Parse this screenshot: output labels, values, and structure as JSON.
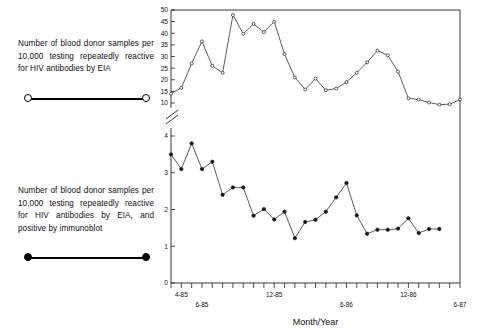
{
  "legend": {
    "items": [
      {
        "caption": "Number of blood donor samples per 10,000 testing repeatedly reactive for HIV antibodies by EIA",
        "marker": "open-circle-line"
      },
      {
        "caption": "Number of blood donor samples per 10,000 testing repeatedly reactive for HIV antibodies by EIA, and positive by immunoblot",
        "marker": "filled-circle-line"
      }
    ]
  },
  "chart_data": {
    "type": "line",
    "title": "",
    "xlabel": "Month/Year",
    "ylabel": "",
    "grid": false,
    "legend_position": "left-external",
    "panels": [
      {
        "name": "upper-panel",
        "ylim": [
          10,
          50
        ],
        "yticks": [
          10,
          15,
          20,
          25,
          30,
          35,
          40,
          45,
          50
        ],
        "ytick_labels": [
          "10",
          "15",
          "20",
          "25",
          "30",
          "35",
          "40",
          "45",
          "50"
        ],
        "axis_break_below": true,
        "series_name": "EIA repeatedly reactive per 10,000",
        "marker": "open-circle",
        "values": [
          14.0,
          16.5,
          27.0,
          36.5,
          26.0,
          23.0,
          47.8,
          39.8,
          44.0,
          40.5,
          45.0,
          31.0,
          21.0,
          15.8,
          20.5,
          15.5,
          16.2,
          19.0,
          23.0,
          27.5,
          32.5,
          30.5,
          23.5,
          12.0,
          11.5,
          10.2,
          9.3,
          9.5,
          11.5
        ]
      },
      {
        "name": "lower-panel",
        "ylim": [
          0,
          4
        ],
        "yticks": [
          0,
          1,
          2,
          3,
          4
        ],
        "ytick_labels": [
          "0",
          "1",
          "2",
          "3",
          "4"
        ],
        "series_name": "EIA reactive and immunoblot positive per 10,000",
        "marker": "filled-circle",
        "values": [
          3.5,
          3.1,
          3.8,
          3.1,
          3.3,
          2.4,
          2.6,
          2.6,
          1.83,
          2.01,
          1.73,
          1.94,
          1.22,
          1.66,
          1.72,
          1.94,
          2.33,
          2.72,
          1.84,
          1.34,
          1.45,
          1.45,
          1.48,
          1.76,
          1.36,
          1.47,
          1.47
        ]
      }
    ],
    "x_count": 29,
    "xtick_labels": [
      {
        "text": "4-85",
        "index": 1,
        "row": 0
      },
      {
        "text": "6-85",
        "index": 3,
        "row": 1
      },
      {
        "text": "12-85",
        "index": 10,
        "row": 0
      },
      {
        "text": "6-86",
        "index": 17,
        "row": 1
      },
      {
        "text": "12-86",
        "index": 23,
        "row": 0
      },
      {
        "text": "6-87",
        "index": 28,
        "row": 1
      }
    ]
  },
  "colors": {
    "line": "#333333",
    "axis": "#222222",
    "text": "#111111",
    "background": "#ffffff"
  }
}
